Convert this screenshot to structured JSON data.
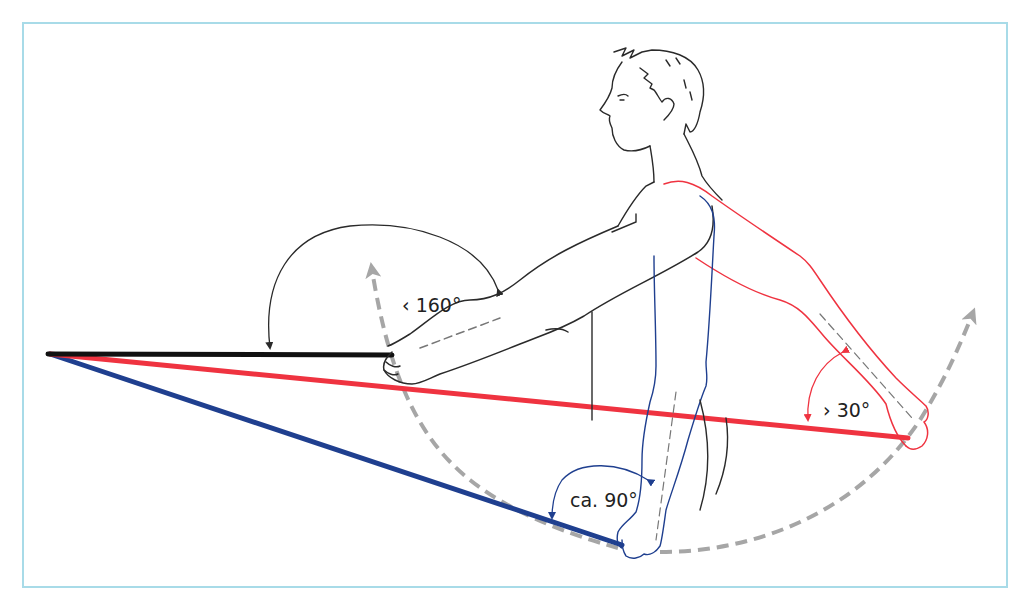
{
  "figure": {
    "colors": {
      "frame": "#a8dbe8",
      "black_position": "#1a1a1a",
      "red_position": "#ef3340",
      "blue_position": "#1f3f8f",
      "arc_dashed": "#a6a6a6",
      "outline": "#2a2a2a"
    }
  },
  "annotations": {
    "angle_black": "‹ 160°",
    "angle_red": "› 30°",
    "angle_blue": "ca. 90°"
  },
  "positions": [
    {
      "name": "black",
      "description": "arm extended forward, bar horizontal",
      "angle_label": "‹ 160°"
    },
    {
      "name": "red",
      "description": "arm extended backward, bar angled slightly down",
      "angle_label": "› 30°"
    },
    {
      "name": "blue",
      "description": "arm hanging down, bar angled steeply down",
      "angle_label": "ca. 90°"
    }
  ]
}
